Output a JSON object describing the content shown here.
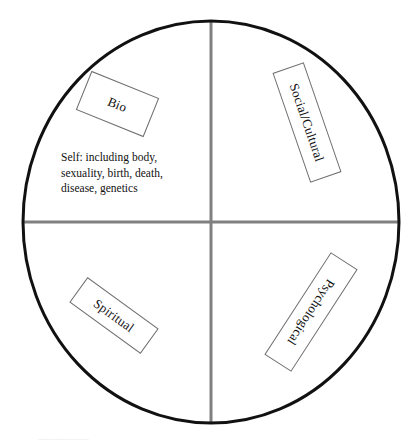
{
  "diagram": {
    "shape": "circle",
    "colors": {
      "circle_stroke": "#111111",
      "axis_stroke": "#808080",
      "box_stroke": "#6f6f6f",
      "text": "#111111",
      "background": "#ffffff"
    },
    "geometry": {
      "circle_center_x": 211,
      "circle_center_y": 222,
      "circle_radius_x": 189,
      "circle_radius_y": 202,
      "circle_stroke_width": 3,
      "axis_stroke_width": 3
    },
    "quadrant_labels": [
      {
        "id": "bio",
        "label": "Bio",
        "quadrant": "upper-left",
        "rotation_deg": 22
      },
      {
        "id": "social-cultural",
        "label": "Social/Cultural",
        "quadrant": "upper-right",
        "rotation_deg": 71
      },
      {
        "id": "spiritual",
        "label": "Spiritual",
        "quadrant": "lower-left",
        "rotation_deg": 36
      },
      {
        "id": "psychological",
        "label": "Psychological",
        "quadrant": "lower-right",
        "rotation_deg": 123
      }
    ],
    "self_description": {
      "quadrant": "upper-left",
      "lines": [
        "Self: including body,",
        "sexuality, birth, death,",
        "disease, genetics"
      ]
    },
    "caption_remnant": "............................."
  }
}
